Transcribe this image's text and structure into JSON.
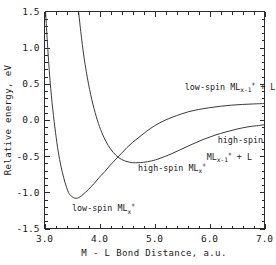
{
  "chart_data": {
    "type": "line",
    "title": "",
    "xlabel": "M - L Bond Distance, a.u.",
    "ylabel": "Relative energy, eV",
    "xlim": [
      3.0,
      7.0
    ],
    "ylim": [
      -1.5,
      1.5
    ],
    "grid": false,
    "legend_position": "inline-annotations",
    "xticks": [
      3.0,
      4.0,
      5.0,
      6.0,
      7.0
    ],
    "xtick_labels": [
      "3.0",
      "4.0",
      "5.0",
      "6.0",
      "7.0"
    ],
    "xminor_interval": 0.2,
    "yticks": [
      -1.5,
      -1.0,
      -0.5,
      0.0,
      0.5,
      1.0,
      1.5
    ],
    "ytick_labels": [
      "-1.5",
      "-1.0",
      "-0.5",
      "0.0",
      "0.5",
      "1.0",
      "1.5"
    ],
    "yminor_interval": 0.1,
    "series": [
      {
        "name": "low-spin MLx+",
        "label_html": "low-spin ML_x^+",
        "x": [
          3.02,
          3.05,
          3.1,
          3.15,
          3.2,
          3.25,
          3.3,
          3.35,
          3.4,
          3.45,
          3.5,
          3.55,
          3.6,
          3.65,
          3.7,
          3.8,
          3.9,
          4.0,
          4.1,
          4.2,
          4.3,
          4.4,
          4.5,
          4.6,
          4.7,
          4.85,
          5.0,
          5.2,
          5.4,
          5.6,
          5.8,
          6.0,
          6.2,
          6.4,
          6.6,
          6.8,
          7.0
        ],
        "y": [
          1.5,
          1.1,
          0.55,
          0.15,
          -0.17,
          -0.44,
          -0.64,
          -0.8,
          -0.93,
          -1.02,
          -1.06,
          -1.08,
          -1.08,
          -1.06,
          -1.03,
          -0.96,
          -0.88,
          -0.79,
          -0.71,
          -0.62,
          -0.54,
          -0.46,
          -0.38,
          -0.31,
          -0.25,
          -0.16,
          -0.08,
          0.0,
          0.06,
          0.11,
          0.145,
          0.17,
          0.19,
          0.205,
          0.215,
          0.222,
          0.228
        ]
      },
      {
        "name": "high-spin MLx+",
        "label_html": "high-spin ML_x^+",
        "x": [
          3.62,
          3.66,
          3.72,
          3.8,
          3.88,
          3.96,
          4.04,
          4.12,
          4.2,
          4.3,
          4.4,
          4.5,
          4.6,
          4.7,
          4.8,
          4.95,
          5.1,
          5.3,
          5.5,
          5.7,
          5.9,
          6.1,
          6.3,
          6.5,
          6.7,
          6.85,
          7.0
        ],
        "y": [
          1.5,
          1.22,
          0.86,
          0.5,
          0.22,
          0.0,
          -0.17,
          -0.3,
          -0.4,
          -0.49,
          -0.545,
          -0.575,
          -0.59,
          -0.59,
          -0.585,
          -0.565,
          -0.53,
          -0.47,
          -0.4,
          -0.33,
          -0.265,
          -0.21,
          -0.165,
          -0.125,
          -0.095,
          -0.08,
          -0.065
        ]
      }
    ],
    "annotations": [
      {
        "id": "low-spin-dissociated",
        "text": "low-spin ML",
        "sub": "x-1",
        "sup": "+",
        "tail": " + L",
        "x_data": 5.55,
        "y_data": 0.42
      },
      {
        "id": "high-spin-bound",
        "text": "high-spin ML",
        "sub": "x",
        "sup": "+",
        "tail": "",
        "x_data": 4.7,
        "y_data": -0.7
      },
      {
        "id": "high-spin-dissociated-line1",
        "text": "high-spin",
        "sub": "",
        "sup": "",
        "tail": "",
        "x_data": 6.15,
        "y_data": -0.32
      },
      {
        "id": "high-spin-dissociated-line2",
        "text": "ML",
        "sub": "x-1",
        "sup": "+",
        "tail": " + L",
        "x_data": 5.95,
        "y_data": -0.55
      },
      {
        "id": "low-spin-bound",
        "text": "low-spin  ML",
        "sub": "x",
        "sup": "+",
        "tail": "",
        "x_data": 3.5,
        "y_data": -1.26
      }
    ]
  },
  "colors": {
    "background": "#ffffff",
    "axis": "#2b2b2b",
    "curve": "#3a3a3a",
    "text": "#1a1a1a"
  }
}
